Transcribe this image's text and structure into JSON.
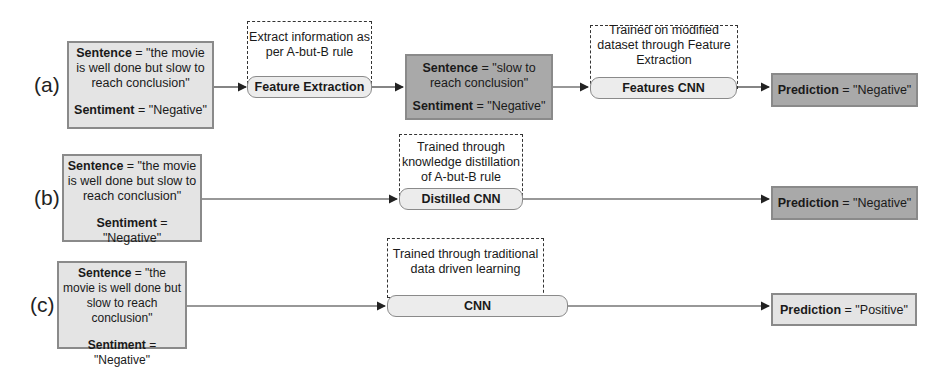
{
  "rows": [
    {
      "label": "(a)",
      "input": {
        "sentence_key": "Sentence",
        "sentence_val": "= \"the movie is well done but slow to reach conclusion\"",
        "sentiment_key": "Sentiment",
        "sentiment_val": "= \"Negative\""
      },
      "step1": {
        "note": "Extract information as per A-but-B rule",
        "pill": "Feature Extraction"
      },
      "intermediate": {
        "sentence_key": "Sentence",
        "sentence_val": "= \"slow to reach conclusion\"",
        "sentiment_key": "Sentiment",
        "sentiment_val": "= \"Negative\""
      },
      "step2": {
        "note": "Trained on modified dataset through Feature Extraction",
        "pill": "Features CNN"
      },
      "prediction": {
        "key": "Prediction",
        "val": "= \"Negative\""
      }
    },
    {
      "label": "(b)",
      "input": {
        "sentence_key": "Sentence",
        "sentence_val": "= \"the movie is well done but slow to reach conclusion\"",
        "sentiment_key": "Sentiment",
        "sentiment_val": "= \"Negative\""
      },
      "step": {
        "note": "Trained through knowledge distillation of A-but-B rule",
        "pill": "Distilled CNN"
      },
      "prediction": {
        "key": "Prediction",
        "val": "= \"Negative\""
      }
    },
    {
      "label": "(c)",
      "input": {
        "sentence_key": "Sentence",
        "sentence_val": "= \"the movie is well done but slow to reach conclusion\"",
        "sentiment_key": "Sentiment",
        "sentiment_val": "= \"Negative\""
      },
      "step": {
        "note": "Trained through traditional data driven learning",
        "pill": "CNN"
      },
      "prediction": {
        "key": "Prediction",
        "val": "= \"Positive\""
      }
    }
  ],
  "colors": {
    "input_fill": "#e4e4e4",
    "dark_fill": "#a9a9a9",
    "border": "#8a8a8a",
    "pill_fill": "#ececec"
  }
}
